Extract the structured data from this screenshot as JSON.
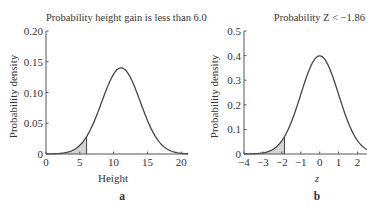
{
  "chart_data": [
    {
      "type": "line",
      "panel_label": "a",
      "title": "Probability height gain is less than 6.0",
      "xlabel": "Height",
      "ylabel": "Probability density",
      "xlim": [
        0,
        21
      ],
      "ylim": [
        0,
        0.2
      ],
      "xticks": [
        0,
        5,
        10,
        15,
        20
      ],
      "xtick_labels": [
        "0",
        "5",
        "10",
        "15",
        "20"
      ],
      "yticks": [
        0,
        0.05,
        0.1,
        0.15,
        0.2
      ],
      "ytick_labels": [
        "0",
        "0.05",
        "0.10",
        "0.15",
        "0.20"
      ],
      "distribution": {
        "kind": "normal",
        "mean": 11.1,
        "sd": 2.85
      },
      "peak": {
        "x": 11.1,
        "y": 0.14
      },
      "shaded_region": {
        "from": 0,
        "to": 6.0
      },
      "grid": false,
      "legend": null
    },
    {
      "type": "line",
      "panel_label": "b",
      "title": "Probability Z < −1.86",
      "xlabel": "z",
      "ylabel": "Probability density",
      "xlim": [
        -4,
        2.5
      ],
      "ylim": [
        0,
        0.5
      ],
      "xticks": [
        -4,
        -3,
        -2,
        -1,
        0,
        1,
        2
      ],
      "xtick_labels": [
        "−4",
        "−3",
        "−2",
        "−1",
        "0",
        "1",
        "2"
      ],
      "yticks": [
        0,
        0.1,
        0.2,
        0.3,
        0.4,
        0.5
      ],
      "ytick_labels": [
        "0",
        "0.1",
        "0.2",
        "0.3",
        "0.4",
        "0.5"
      ],
      "distribution": {
        "kind": "normal",
        "mean": 0,
        "sd": 1
      },
      "peak": {
        "x": 0,
        "y": 0.399
      },
      "shaded_region": {
        "from": -4,
        "to": -1.86
      },
      "grid": false,
      "legend": null
    }
  ],
  "style": {
    "line_color": "#444444",
    "shade_color": "#d4d4d4",
    "axis_color": "#555555"
  }
}
